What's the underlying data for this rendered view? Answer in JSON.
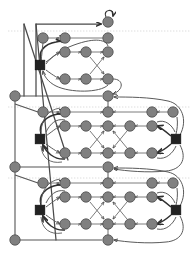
{
  "figure": {
    "type": "directed-graph-diagram",
    "width": 190,
    "height": 254,
    "background": "#ffffff",
    "title": "",
    "caption": ""
  },
  "style": {
    "circle_fill": "#808080",
    "circle_stroke": "#4d4d4d",
    "square_fill": "#222222",
    "square_stroke": "#111111",
    "edge_color": "#5a5a5a",
    "edge_thick_color": "#3a3a3a",
    "guide_color": "#cfcfcf",
    "circle_radius": 5.2,
    "square_size": 9.5,
    "edge_width": 0.8,
    "edge_thick_width": 1.6,
    "guide_width": 0.6
  },
  "guides": [
    {
      "name": "guide-line-top",
      "y": 31,
      "x1": 8,
      "x2": 190
    },
    {
      "name": "guide-line-mid",
      "y": 107,
      "x1": 8,
      "x2": 190
    },
    {
      "name": "guide-line-low",
      "y": 178,
      "x1": 8,
      "x2": 190
    }
  ],
  "nodes": {
    "circles": [
      {
        "id": "n-top-self",
        "name": "node-entry-top",
        "x": 108,
        "y": 22
      },
      {
        "id": "n-t-r0c0",
        "name": "node-top-row0-col0",
        "x": 43,
        "y": 38
      },
      {
        "id": "n-t-r0c1",
        "name": "node-top-row0-col1",
        "x": 65,
        "y": 38
      },
      {
        "id": "n-t-r0c2",
        "name": "node-top-row0-col2",
        "x": 108,
        "y": 38
      },
      {
        "id": "n-t-r1c0",
        "name": "node-top-row1-col0",
        "x": 65,
        "y": 52
      },
      {
        "id": "n-t-r1c1",
        "name": "node-top-row1-col1",
        "x": 86,
        "y": 52
      },
      {
        "id": "n-t-r1c2",
        "name": "node-top-row1-col2",
        "x": 108,
        "y": 52
      },
      {
        "id": "n-t-r2c0",
        "name": "node-top-row2-col0",
        "x": 65,
        "y": 79
      },
      {
        "id": "n-t-r2c1",
        "name": "node-top-row2-col1",
        "x": 86,
        "y": 79
      },
      {
        "id": "n-t-r2c2",
        "name": "node-top-row2-col2",
        "x": 108,
        "y": 79
      },
      {
        "id": "n-spine-0",
        "name": "node-spine-upper",
        "x": 15,
        "y": 96
      },
      {
        "id": "n-join-0",
        "name": "node-join-upper",
        "x": 108,
        "y": 96
      },
      {
        "id": "n-m-r0c0",
        "name": "node-mid-row0-col0",
        "x": 43,
        "y": 112
      },
      {
        "id": "n-m-r0c1",
        "name": "node-mid-row0-col1",
        "x": 65,
        "y": 112
      },
      {
        "id": "n-m-r0c2",
        "name": "node-mid-row0-col2",
        "x": 108,
        "y": 112
      },
      {
        "id": "n-m-r0c3",
        "name": "node-mid-row0-col3",
        "x": 152,
        "y": 112
      },
      {
        "id": "n-m-r0c4",
        "name": "node-mid-row0-col4",
        "x": 173,
        "y": 112
      },
      {
        "id": "n-m-r1c0",
        "name": "node-mid-row1-col0",
        "x": 65,
        "y": 126
      },
      {
        "id": "n-m-r1c1",
        "name": "node-mid-row1-col1",
        "x": 86,
        "y": 126
      },
      {
        "id": "n-m-r1c2",
        "name": "node-mid-row1-col2",
        "x": 108,
        "y": 126
      },
      {
        "id": "n-m-r1c3",
        "name": "node-mid-row1-col3",
        "x": 130,
        "y": 126
      },
      {
        "id": "n-m-r1c4",
        "name": "node-mid-row1-col4",
        "x": 152,
        "y": 126
      },
      {
        "id": "n-m-r2c0",
        "name": "node-mid-row2-col0",
        "x": 65,
        "y": 153
      },
      {
        "id": "n-m-r2c1",
        "name": "node-mid-row2-col1",
        "x": 86,
        "y": 153
      },
      {
        "id": "n-m-r2c2",
        "name": "node-mid-row2-col2",
        "x": 108,
        "y": 153
      },
      {
        "id": "n-m-r2c3",
        "name": "node-mid-row2-col3",
        "x": 130,
        "y": 153
      },
      {
        "id": "n-m-r2c4",
        "name": "node-mid-row2-col4",
        "x": 152,
        "y": 153
      },
      {
        "id": "n-spine-1",
        "name": "node-spine-lower",
        "x": 15,
        "y": 167
      },
      {
        "id": "n-join-1",
        "name": "node-join-lower",
        "x": 108,
        "y": 167
      },
      {
        "id": "n-b-r0c0",
        "name": "node-bot-row0-col0",
        "x": 43,
        "y": 183
      },
      {
        "id": "n-b-r0c1",
        "name": "node-bot-row0-col1",
        "x": 65,
        "y": 183
      },
      {
        "id": "n-b-r0c2",
        "name": "node-bot-row0-col2",
        "x": 108,
        "y": 183
      },
      {
        "id": "n-b-r0c3",
        "name": "node-bot-row0-col3",
        "x": 152,
        "y": 183
      },
      {
        "id": "n-b-r0c4",
        "name": "node-bot-row0-col4",
        "x": 173,
        "y": 183
      },
      {
        "id": "n-b-r1c0",
        "name": "node-bot-row1-col0",
        "x": 65,
        "y": 197
      },
      {
        "id": "n-b-r1c1",
        "name": "node-bot-row1-col1",
        "x": 86,
        "y": 197
      },
      {
        "id": "n-b-r1c2",
        "name": "node-bot-row1-col2",
        "x": 108,
        "y": 197
      },
      {
        "id": "n-b-r1c3",
        "name": "node-bot-row1-col3",
        "x": 130,
        "y": 197
      },
      {
        "id": "n-b-r1c4",
        "name": "node-bot-row1-col4",
        "x": 152,
        "y": 197
      },
      {
        "id": "n-b-r2c0",
        "name": "node-bot-row2-col0",
        "x": 65,
        "y": 224
      },
      {
        "id": "n-b-r2c1",
        "name": "node-bot-row2-col1",
        "x": 86,
        "y": 224
      },
      {
        "id": "n-b-r2c2",
        "name": "node-bot-row2-col2",
        "x": 108,
        "y": 224
      },
      {
        "id": "n-b-r2c3",
        "name": "node-bot-row2-col3",
        "x": 130,
        "y": 224
      },
      {
        "id": "n-b-r2c4",
        "name": "node-bot-row2-col4",
        "x": 152,
        "y": 224
      },
      {
        "id": "n-spine-2",
        "name": "node-spine-bottom",
        "x": 15,
        "y": 240
      },
      {
        "id": "n-join-2",
        "name": "node-join-bottom",
        "x": 108,
        "y": 240
      }
    ],
    "squares": [
      {
        "id": "s-top-left",
        "name": "square-hub-top-left",
        "x": 40,
        "y": 65
      },
      {
        "id": "s-mid-left",
        "name": "square-hub-mid-left",
        "x": 40,
        "y": 139
      },
      {
        "id": "s-mid-right",
        "name": "square-hub-mid-right",
        "x": 176,
        "y": 139
      },
      {
        "id": "s-bot-left",
        "name": "square-hub-bot-left",
        "x": 40,
        "y": 210
      },
      {
        "id": "s-bot-right",
        "name": "square-hub-bot-right",
        "x": 176,
        "y": 210
      }
    ]
  },
  "edges": {
    "straight": [
      {
        "from": "n-t-r0c0",
        "to": "n-t-r0c1",
        "arrow": true
      },
      {
        "from": "n-t-r0c1",
        "to": "n-t-r0c2",
        "arrow": false
      },
      {
        "from": "n-t-r1c0",
        "to": "n-t-r1c1",
        "arrow": true
      },
      {
        "from": "n-t-r1c1",
        "to": "n-t-r1c2",
        "arrow": true
      },
      {
        "from": "n-t-r2c0",
        "to": "n-t-r2c1",
        "arrow": true
      },
      {
        "from": "n-t-r2c1",
        "to": "n-t-r2c2",
        "arrow": true
      },
      {
        "from": "n-t-r1c1",
        "to": "n-t-r2c2",
        "arrow": true
      },
      {
        "from": "n-t-r2c1",
        "to": "n-t-r1c2",
        "arrow": true
      },
      {
        "from": "n-m-r0c0",
        "to": "n-m-r0c1",
        "arrow": true
      },
      {
        "from": "n-m-r0c1",
        "to": "n-m-r0c2",
        "arrow": true
      },
      {
        "from": "n-m-r0c3",
        "to": "n-m-r0c2",
        "arrow": true
      },
      {
        "from": "n-m-r0c4",
        "to": "n-m-r0c3",
        "arrow": true
      },
      {
        "from": "n-m-r1c0",
        "to": "n-m-r1c1",
        "arrow": true
      },
      {
        "from": "n-m-r1c1",
        "to": "n-m-r1c2",
        "arrow": true
      },
      {
        "from": "n-m-r1c3",
        "to": "n-m-r1c2",
        "arrow": true
      },
      {
        "from": "n-m-r1c4",
        "to": "n-m-r1c3",
        "arrow": true
      },
      {
        "from": "n-m-r2c0",
        "to": "n-m-r2c1",
        "arrow": true
      },
      {
        "from": "n-m-r2c1",
        "to": "n-m-r2c2",
        "arrow": true
      },
      {
        "from": "n-m-r2c3",
        "to": "n-m-r2c2",
        "arrow": true
      },
      {
        "from": "n-m-r2c4",
        "to": "n-m-r2c3",
        "arrow": true
      },
      {
        "from": "n-m-r1c1",
        "to": "n-m-r2c2",
        "arrow": true
      },
      {
        "from": "n-m-r2c1",
        "to": "n-m-r1c2",
        "arrow": true
      },
      {
        "from": "n-m-r1c3",
        "to": "n-m-r2c2",
        "arrow": true
      },
      {
        "from": "n-m-r2c3",
        "to": "n-m-r1c2",
        "arrow": true
      },
      {
        "from": "n-b-r0c0",
        "to": "n-b-r0c1",
        "arrow": true
      },
      {
        "from": "n-b-r0c1",
        "to": "n-b-r0c2",
        "arrow": true
      },
      {
        "from": "n-b-r0c3",
        "to": "n-b-r0c2",
        "arrow": true
      },
      {
        "from": "n-b-r0c4",
        "to": "n-b-r0c3",
        "arrow": true
      },
      {
        "from": "n-b-r1c0",
        "to": "n-b-r1c1",
        "arrow": true
      },
      {
        "from": "n-b-r1c1",
        "to": "n-b-r1c2",
        "arrow": true
      },
      {
        "from": "n-b-r1c3",
        "to": "n-b-r1c2",
        "arrow": true
      },
      {
        "from": "n-b-r1c4",
        "to": "n-b-r1c3",
        "arrow": true
      },
      {
        "from": "n-b-r2c0",
        "to": "n-b-r2c1",
        "arrow": true
      },
      {
        "from": "n-b-r2c1",
        "to": "n-b-r2c2",
        "arrow": true
      },
      {
        "from": "n-b-r2c3",
        "to": "n-b-r2c2",
        "arrow": true
      },
      {
        "from": "n-b-r2c4",
        "to": "n-b-r2c3",
        "arrow": true
      },
      {
        "from": "n-b-r1c1",
        "to": "n-b-r2c2",
        "arrow": true
      },
      {
        "from": "n-b-r2c1",
        "to": "n-b-r1c2",
        "arrow": true
      },
      {
        "from": "n-b-r1c3",
        "to": "n-b-r2c2",
        "arrow": true
      },
      {
        "from": "n-b-r2c3",
        "to": "n-b-r1c2",
        "arrow": true
      }
    ],
    "spine": [
      {
        "name": "spine-upper-to-lower",
        "from": "n-spine-0",
        "to": "n-spine-1"
      },
      {
        "name": "spine-lower-to-bottom",
        "from": "n-spine-1",
        "to": "n-spine-2"
      },
      {
        "name": "spine-upper-to-join",
        "from": "n-spine-0",
        "to": "n-join-0"
      },
      {
        "name": "spine-lower-to-join",
        "from": "n-spine-1",
        "to": "n-join-1"
      },
      {
        "name": "spine-bottom-to-join",
        "from": "n-spine-2",
        "to": "n-join-2"
      }
    ],
    "long_feedback": [
      {
        "name": "feedback-top-entry",
        "desc": "left frame up to entry node"
      },
      {
        "name": "feedback-diagonal-upper",
        "desc": "diagonal from top frame down to mid join"
      },
      {
        "name": "feedback-diagonal-lower",
        "desc": "diagonal from top frame down to lower join"
      }
    ]
  },
  "counts": {
    "circle_nodes": 46,
    "square_nodes": 5,
    "blocks": 3,
    "guide_lines": 3
  }
}
